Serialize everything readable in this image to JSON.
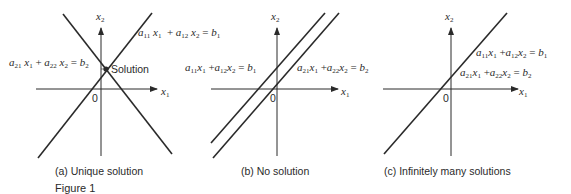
{
  "figure_label": "Figure 1",
  "panels": [
    {
      "id": "a",
      "caption": "(a)  Unique solution",
      "x_axis_label": "x",
      "x_axis_sub": "1",
      "y_axis_label": "x",
      "y_axis_sub": "2",
      "origin_label": "0",
      "point_label": "Solution",
      "eq1": {
        "a": "a",
        "a_sub": "11",
        "x": "x",
        "x_sub": "1",
        "plus": "+",
        "a2": "a",
        "a2_sub": "12",
        "x2": "x",
        "x2_sub": "2",
        "eq": "=",
        "b": "b",
        "b_sub": "1"
      },
      "eq2": {
        "a": "a",
        "a_sub": "21",
        "x": "x",
        "x_sub": "1",
        "plus": "+",
        "a2": "a",
        "a2_sub": "22",
        "x2": "x",
        "x2_sub": "2",
        "eq": "=",
        "b": "b",
        "b_sub": "2"
      }
    },
    {
      "id": "b",
      "caption": "(b)  No solution",
      "x_axis_label": "x",
      "x_axis_sub": "1",
      "y_axis_label": "x",
      "y_axis_sub": "2",
      "origin_label": "0",
      "eq1": {
        "a": "a",
        "a_sub": "11",
        "x": "x",
        "x_sub": "1",
        "plus": "+",
        "a2": "a",
        "a2_sub": "12",
        "x2": "x",
        "x2_sub": "2",
        "eq": "=",
        "b": "b",
        "b_sub": "1"
      },
      "eq2": {
        "a": "a",
        "a_sub": "21",
        "x": "x",
        "x_sub": "1",
        "plus": "+",
        "a2": "a",
        "a2_sub": "22",
        "x2": "x",
        "x2_sub": "2",
        "eq": "=",
        "b": "b",
        "b_sub": "2"
      }
    },
    {
      "id": "c",
      "caption": "(c)  Infinitely many solutions",
      "x_axis_label": "x",
      "x_axis_sub": "1",
      "y_axis_label": "x",
      "y_axis_sub": "2",
      "origin_label": "0",
      "eq1": {
        "a": "a",
        "a_sub": "11",
        "x": "x",
        "x_sub": "1",
        "plus": "+",
        "a2": "a",
        "a2_sub": "12",
        "x2": "x",
        "x2_sub": "2",
        "eq": "=",
        "b": "b",
        "b_sub": "1"
      },
      "eq2": {
        "a": "a",
        "a_sub": "21",
        "x": "x",
        "x_sub": "1",
        "plus": "+",
        "a2": "a",
        "a2_sub": "22",
        "x2": "x",
        "x2_sub": "2",
        "eq": "=",
        "b": "b",
        "b_sub": "2"
      }
    }
  ],
  "colors": {
    "ink": "#2a2a2a",
    "background": "#ffffff"
  }
}
